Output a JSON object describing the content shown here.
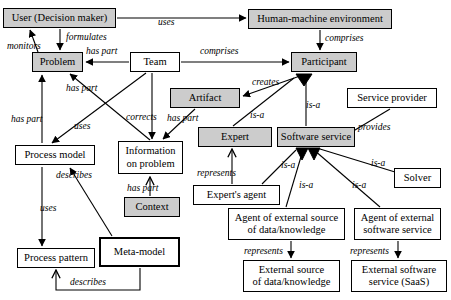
{
  "diagram": {
    "style": {
      "shaded_fill": "#cccccc",
      "node_fill": "#ffffff",
      "line_color": "#000000"
    },
    "nodes": [
      {
        "id": "user",
        "label": "User (Decision maker)",
        "shaded": true,
        "bold": false,
        "x": 3,
        "y": 8,
        "w": 113,
        "h": 20
      },
      {
        "id": "hme",
        "label": "Human-machine environment",
        "shaded": true,
        "bold": false,
        "x": 248,
        "y": 9,
        "w": 144,
        "h": 20
      },
      {
        "id": "problem",
        "label": "Problem",
        "shaded": true,
        "bold": false,
        "x": 32,
        "y": 52,
        "w": 51,
        "h": 20
      },
      {
        "id": "team",
        "label": "Team",
        "shaded": false,
        "bold": false,
        "x": 130,
        "y": 52,
        "w": 50,
        "h": 20
      },
      {
        "id": "participant",
        "label": "Participant",
        "shaded": true,
        "bold": false,
        "x": 291,
        "y": 52,
        "w": 66,
        "h": 20
      },
      {
        "id": "artifact",
        "label": "Artifact",
        "shaded": true,
        "bold": false,
        "x": 170,
        "y": 88,
        "w": 70,
        "h": 20
      },
      {
        "id": "provider",
        "label": "Service provider",
        "shaded": false,
        "bold": false,
        "x": 347,
        "y": 88,
        "w": 90,
        "h": 20
      },
      {
        "id": "processmodel",
        "label": "Process model",
        "shaded": false,
        "bold": false,
        "x": 15,
        "y": 145,
        "w": 80,
        "h": 20
      },
      {
        "id": "infoproblem",
        "label": "Information\non problem",
        "shaded": false,
        "bold": false,
        "x": 118,
        "y": 141,
        "w": 65,
        "h": 33
      },
      {
        "id": "expert",
        "label": "Expert",
        "shaded": true,
        "bold": false,
        "x": 198,
        "y": 127,
        "w": 74,
        "h": 20
      },
      {
        "id": "swservice",
        "label": "Software service",
        "shaded": true,
        "bold": false,
        "x": 277,
        "y": 127,
        "w": 78,
        "h": 20
      },
      {
        "id": "solver",
        "label": "Solver",
        "shaded": false,
        "bold": false,
        "x": 394,
        "y": 168,
        "w": 47,
        "h": 20
      },
      {
        "id": "context",
        "label": "Context",
        "shaded": true,
        "bold": false,
        "x": 124,
        "y": 197,
        "w": 56,
        "h": 20
      },
      {
        "id": "expertagent",
        "label": "Expert's agent",
        "shaded": false,
        "bold": false,
        "x": 193,
        "y": 185,
        "w": 87,
        "h": 20
      },
      {
        "id": "agentext",
        "label": "Agent of external source\nof data/knowledge",
        "shaded": false,
        "bold": false,
        "x": 228,
        "y": 208,
        "w": 117,
        "h": 32
      },
      {
        "id": "agentsw",
        "label": "Agent of external\nsoftware service",
        "shaded": false,
        "bold": false,
        "x": 354,
        "y": 208,
        "w": 87,
        "h": 32
      },
      {
        "id": "metamodel",
        "label": "Meta-model",
        "shaded": false,
        "bold": true,
        "x": 99,
        "y": 237,
        "w": 81,
        "h": 30
      },
      {
        "id": "processpattern",
        "label": "Process pattern",
        "shaded": false,
        "bold": false,
        "x": 17,
        "y": 248,
        "w": 78,
        "h": 20
      },
      {
        "id": "extsource",
        "label": "External source\nof data/knowledge",
        "shaded": false,
        "bold": false,
        "x": 243,
        "y": 260,
        "w": 97,
        "h": 32
      },
      {
        "id": "extsw",
        "label": "External software\nservice (SaaS)",
        "shaded": false,
        "bold": false,
        "x": 351,
        "y": 260,
        "w": 96,
        "h": 32
      }
    ],
    "edge_labels": [
      {
        "id": "l-uses-hme",
        "text": "uses",
        "x": 158,
        "y": 17
      },
      {
        "id": "l-formulates",
        "text": "formulates",
        "x": 66,
        "y": 32
      },
      {
        "id": "l-monitors",
        "text": "monitors",
        "x": 7,
        "y": 41
      },
      {
        "id": "l-haspart-team",
        "text": "has part",
        "x": 86,
        "y": 46
      },
      {
        "id": "l-comprises-team",
        "text": "comprises",
        "x": 200,
        "y": 46
      },
      {
        "id": "l-comprises-hme",
        "text": "comprises",
        "x": 325,
        "y": 33
      },
      {
        "id": "l-creates",
        "text": "creates",
        "x": 252,
        "y": 77
      },
      {
        "id": "l-haspart-prob2",
        "text": "has part",
        "x": 66,
        "y": 83
      },
      {
        "id": "l-haspart-prob3",
        "text": "has part",
        "x": 11,
        "y": 114
      },
      {
        "id": "l-corrects",
        "text": "corrects",
        "x": 126,
        "y": 112
      },
      {
        "id": "l-haspart-art",
        "text": "has part",
        "x": 167,
        "y": 113
      },
      {
        "id": "l-isa-expert",
        "text": "is-a",
        "x": 250,
        "y": 110
      },
      {
        "id": "l-provides",
        "text": "provides",
        "x": 358,
        "y": 122
      },
      {
        "id": "l-isa-sw",
        "text": "is-a",
        "x": 306,
        "y": 100
      },
      {
        "id": "l-uses-pm",
        "text": "uses",
        "x": 74,
        "y": 121
      },
      {
        "id": "l-describes-pm",
        "text": "describes",
        "x": 56,
        "y": 170
      },
      {
        "id": "l-uses-pp",
        "text": "uses",
        "x": 40,
        "y": 203
      },
      {
        "id": "l-haspart-ctx",
        "text": "has part",
        "x": 127,
        "y": 183
      },
      {
        "id": "l-represents-ea",
        "text": "represents",
        "x": 197,
        "y": 168
      },
      {
        "id": "l-isa-ea",
        "text": "is-a",
        "x": 281,
        "y": 160
      },
      {
        "id": "l-isa-ext",
        "text": "is-a",
        "x": 299,
        "y": 180
      },
      {
        "id": "l-isa-sw2",
        "text": "is-a",
        "x": 352,
        "y": 180
      },
      {
        "id": "l-isa-solver",
        "text": "is-a",
        "x": 371,
        "y": 158
      },
      {
        "id": "l-describes-mm",
        "text": "describes",
        "x": 70,
        "y": 277
      },
      {
        "id": "l-represents-ext",
        "text": "represents",
        "x": 244,
        "y": 246
      },
      {
        "id": "l-represents-sw",
        "text": "represents",
        "x": 350,
        "y": 246
      }
    ]
  }
}
